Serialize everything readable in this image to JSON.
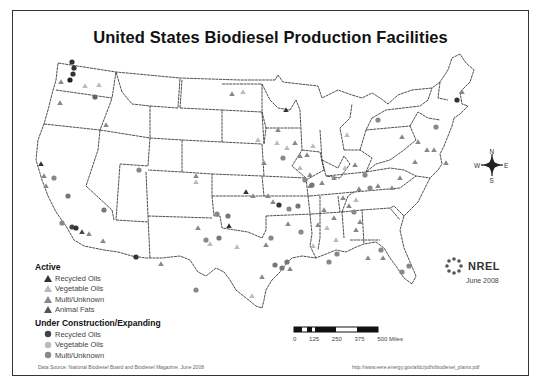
{
  "title": "United States Biodiesel Production Facilities",
  "legend": {
    "active_header": "Active",
    "active_items": [
      {
        "label": "Recycled Oils",
        "symbol": "triangle",
        "color": "#333333"
      },
      {
        "label": "Vegetable Oils",
        "symbol": "triangle",
        "color": "#bbbbbb"
      },
      {
        "label": "Multi/Unknown",
        "symbol": "triangle",
        "color": "#888888"
      },
      {
        "label": "Animal Fats",
        "symbol": "triangle",
        "color": "#555555"
      }
    ],
    "construction_header": "Under Construction/Expanding",
    "construction_items": [
      {
        "label": "Recycled Oils",
        "symbol": "circle",
        "color": "#444444"
      },
      {
        "label": "Vegetable Oils",
        "symbol": "circle",
        "color": "#bbbbbb"
      },
      {
        "label": "Multi/Unknown",
        "symbol": "circle",
        "color": "#888888"
      }
    ]
  },
  "scale": {
    "labels": [
      "0",
      "125",
      "250",
      "375",
      "500 Miles"
    ]
  },
  "compass": {
    "n": "N",
    "s": "S",
    "e": "E",
    "w": "W"
  },
  "logo": {
    "text": "NREL",
    "date": "June 2008"
  },
  "footer": {
    "source": "Data Source: National Biodiesel Board and Biodiesel Magazine, June 2008",
    "url": "http://www.eere.energy.gov/afdc/pdfs/biodiesel_plants.pdf"
  }
}
